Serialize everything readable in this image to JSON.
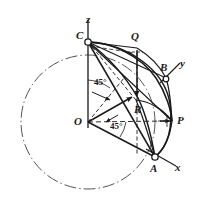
{
  "figure": {
    "type": "geometry-diagram",
    "background_color": "#ffffff",
    "ink_color": "#1a1a1a",
    "width": 200,
    "height": 207
  },
  "axes": [
    {
      "name": "z-axis",
      "label": "z",
      "label_x": 86,
      "label_y": 14
    },
    {
      "name": "y-axis",
      "label": "y",
      "label_x": 180,
      "label_y": 58
    },
    {
      "name": "x-axis",
      "label": "x",
      "label_x": 175,
      "label_y": 162
    }
  ],
  "points": [
    {
      "name": "C",
      "label": "C",
      "x": 88,
      "y": 42,
      "label_x": 76,
      "label_y": 30,
      "marker": true
    },
    {
      "name": "Q",
      "label": "Q",
      "x": 137,
      "y": 48,
      "label_x": 131,
      "label_y": 31,
      "marker": false
    },
    {
      "name": "B",
      "label": "B",
      "x": 166,
      "y": 78,
      "label_x": 160,
      "label_y": 62,
      "marker": true
    },
    {
      "name": "R",
      "label": "R",
      "x": 136,
      "y": 100,
      "label_x": 134,
      "label_y": 104,
      "marker": false
    },
    {
      "name": "P",
      "label": "P",
      "x": 172,
      "y": 121,
      "label_x": 177,
      "label_y": 115,
      "marker": false
    },
    {
      "name": "O",
      "label": "O",
      "x": 88,
      "y": 122,
      "label_x": 74,
      "label_y": 116,
      "marker": false
    },
    {
      "name": "A",
      "label": "A",
      "x": 155,
      "y": 157,
      "label_x": 150,
      "label_y": 163,
      "marker": true
    }
  ],
  "angles": [
    {
      "name": "angle-upper",
      "label": "45°",
      "label_x": 94,
      "label_y": 78,
      "vertex": "O",
      "between": [
        "z-axis",
        "OR"
      ]
    },
    {
      "name": "angle-lower",
      "label": "45°",
      "label_x": 110,
      "label_y": 122,
      "vertex": "O",
      "between": [
        "OP",
        "OA"
      ]
    }
  ],
  "circle": {
    "name": "equatorial-circle",
    "style": "dash-dot",
    "center_x": 88,
    "center_y": 122,
    "radius": 67
  }
}
